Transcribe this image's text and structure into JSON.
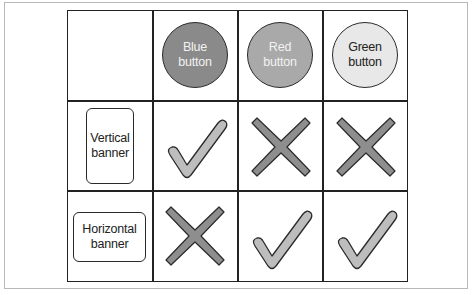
{
  "columns": [
    {
      "label_line1": "Blue",
      "label_line2": "button",
      "fill": "#8a8a8a",
      "text_color": "#f2f2f2"
    },
    {
      "label_line1": "Red",
      "label_line2": "button",
      "fill": "#a9a9a9",
      "text_color": "#f2f2f2"
    },
    {
      "label_line1": "Green",
      "label_line2": "button",
      "fill": "#e8e8e8",
      "text_color": "#222222"
    }
  ],
  "rows": [
    {
      "label_line1": "Vertical",
      "label_line2": "banner",
      "marks": [
        "check",
        "cross",
        "cross"
      ]
    },
    {
      "label_line1": "Horizontal",
      "label_line2": "banner",
      "marks": [
        "cross",
        "check",
        "check"
      ]
    }
  ],
  "colors": {
    "check_fill": "#bdbdbd",
    "cross_fill": "#8e8e8e",
    "outline": "#2a2a2a"
  }
}
